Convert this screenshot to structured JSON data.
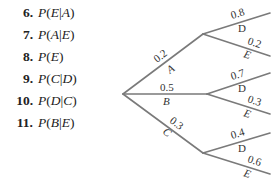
{
  "exercises": [
    {
      "number": "6.",
      "expression": "P(E|A)"
    },
    {
      "number": "7.",
      "expression": "P(A|E)"
    },
    {
      "number": "8.",
      "expression": "P(E)"
    },
    {
      "number": "9.",
      "expression": "P(C|D)"
    },
    {
      "number": "10.",
      "expression": "P(D|C)"
    },
    {
      "number": "11.",
      "expression": "P(B|E)"
    }
  ],
  "tree": {
    "first_stage": [
      {
        "event": "A",
        "probability": "0.2",
        "second_stage": [
          {
            "event": "D",
            "probability": "0.8"
          },
          {
            "event": "E",
            "probability": "0.2"
          }
        ]
      },
      {
        "event": "B",
        "probability": "0.5",
        "second_stage": [
          {
            "event": "D",
            "probability": "0.7"
          },
          {
            "event": "E",
            "probability": "0.3"
          }
        ]
      },
      {
        "event": "C",
        "probability": "0.3",
        "second_stage": [
          {
            "event": "D",
            "probability": "0.4"
          },
          {
            "event": "E",
            "probability": "0.6"
          }
        ]
      }
    ]
  }
}
